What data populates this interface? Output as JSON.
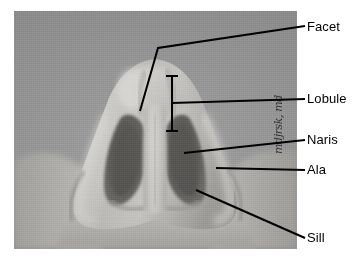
{
  "figure": {
    "type": "anatomical-photograph",
    "view": "nasal base view",
    "background_color": "#ffffff",
    "photo": {
      "tone": "grayscale",
      "background_gray": "#9a9a9a",
      "skin_highlight": "#d8d6d2",
      "skin_midtone": "#b3b1ad",
      "skin_shadow": "#8d8b88",
      "nostril_dark": "#595754",
      "nostril_darkest": "#4a4846"
    },
    "line_color": "#000000"
  },
  "labels": {
    "facet": "Facet",
    "lobule": "Lobule",
    "naris": "Naris",
    "ala": "Ala",
    "sill": "Sill"
  },
  "signature": {
    "text": "mdjrsk, md"
  },
  "annotations": [
    {
      "name": "facet",
      "label": "Facet",
      "leader": "bent",
      "target": "nasal tip facet"
    },
    {
      "name": "lobule",
      "label": "Lobule",
      "leader": "bracket",
      "target": "nasal lobule span"
    },
    {
      "name": "naris",
      "label": "Naris",
      "leader": "straight",
      "target": "right naris aperture"
    },
    {
      "name": "ala",
      "label": "Ala",
      "leader": "straight",
      "target": "alar rim"
    },
    {
      "name": "sill",
      "label": "Sill",
      "leader": "diagonal",
      "target": "nostril sill"
    }
  ]
}
